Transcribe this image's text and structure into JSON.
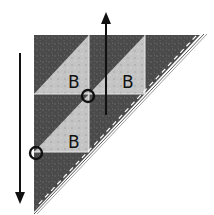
{
  "diagram": {
    "colors": {
      "dark_fabric": "#4a4a4a",
      "light_fabric": "#c8c8c8",
      "seam": "#e8e8e8",
      "ink": "#111111"
    },
    "pieces": [
      {
        "label": "B"
      },
      {
        "label": "B"
      },
      {
        "label": "B"
      }
    ],
    "markers": {
      "circle_count": 2
    },
    "arrows": [
      {
        "direction": "down"
      },
      {
        "direction": "up"
      }
    ]
  }
}
